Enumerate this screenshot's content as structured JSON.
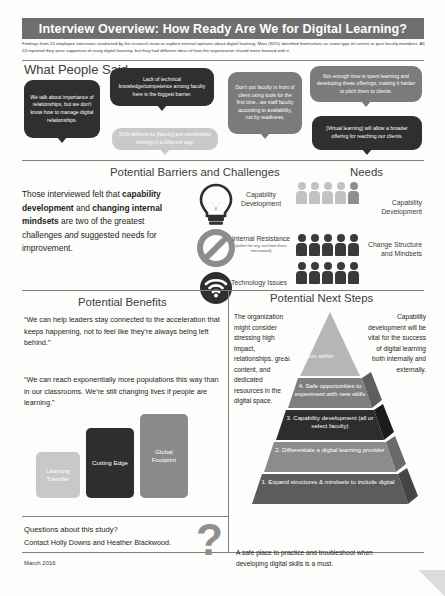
{
  "header": {
    "title": "Interview Overview: How Ready Are We for Digital Learning?",
    "subtitle": "Findings from 24 employee interviews conducted by the research team to explore internal opinions about digital learning. Most (90%) identified themselves as some type of current or past faculty members. All 24 reported they were supportive of using digital learning, but they had different ideas of how the organization should move forward with it."
  },
  "quotes_section": {
    "title": "What People Said...",
    "bubbles": [
      {
        "id": "q1",
        "text": "We talk about importance of relationships, but we don't know how to manage digital relationships.",
        "tone": "dark"
      },
      {
        "id": "q2",
        "text": "Lack of technical knowledge/competence among faculty here is the biggest barrier.",
        "tone": "dark"
      },
      {
        "id": "q3",
        "text": "Shift skillsets so [faculty] are comfortable training in a different way.",
        "tone": "light"
      },
      {
        "id": "q4",
        "text": "Don't put faculty in front of client using tools for the first time...we staff faculty according to availability, not by readiness.",
        "tone": "mid"
      },
      {
        "id": "q5",
        "text": "Not enough time is spent learning and developing these offerings, making it harder to pitch them to clients.",
        "tone": "mid"
      },
      {
        "id": "q6",
        "text": "[Virtual learning] will allow a broader offering for reaching our clients.",
        "tone": "dark"
      }
    ]
  },
  "barriers_section": {
    "title": "Potential Barriers and Challenges",
    "paragraph_parts": {
      "p1": "Those interviewed felt that ",
      "bold1": "capability development",
      "p2": " and ",
      "bold2": "changing internal mindsets",
      "p3": " are two of the greatest challenges ",
      "italic1": "and",
      "p4": " suggested needs for improvement."
    },
    "items": [
      {
        "icon": "lightbulb-icon",
        "label": "Capability Development",
        "sublabel": ""
      },
      {
        "icon": "prohibited-icon",
        "label": "Internal Resistance",
        "sublabel": "(within the org; not from those interviewed)"
      },
      {
        "icon": "wifi-icon",
        "label": "Technology Issues",
        "sublabel": ""
      }
    ]
  },
  "needs_section": {
    "title": "Needs",
    "items": [
      {
        "label": "Capability Development",
        "people_count": 5,
        "tone": "light"
      },
      {
        "label": "Change Structure and Mindsets",
        "people_count": 5,
        "tone": "dark"
      }
    ]
  },
  "benefits_section": {
    "title": "Potential Benefits",
    "quotes": [
      "“We can help leaders stay connected to the acceleration that keeps happening, not to feel like they’re always being left behind.”",
      "“We can reach exponentially more populations this way than in our classrooms. We’re still changing lives if people are learning.”"
    ],
    "bars": [
      {
        "label": "Learning Transfer",
        "tone": "light"
      },
      {
        "label": "Cutting Edge",
        "tone": "dark"
      },
      {
        "label": "Global Footprint",
        "tone": "mid"
      }
    ]
  },
  "next_steps_section": {
    "title": "Potential Next Steps",
    "left_note": "The organization might consider stressing high impact, relationships, great content, and dedicated resources in the digital space.",
    "right_note": "Capability development will be vital for the success of digital learning both internally and externally.",
    "pyramid": [
      {
        "number": "5.",
        "text": "5. Learn from within",
        "tone": "light"
      },
      {
        "number": "4.",
        "text": "4. Safe opportunities to experiment with new skills",
        "tone": "mid"
      },
      {
        "number": "3.",
        "text": "3. Capability development (all or select faculty)",
        "tone": "dark"
      },
      {
        "number": "2.",
        "text": "2. Differentiate a digital learning provider",
        "tone": "mid"
      },
      {
        "number": "1.",
        "text": "1.    Expand structures & mindsets to include digital",
        "tone": "dark-mid"
      }
    ],
    "footer_note": "A safe place to practice and troubleshoot when developing digital skills is a must."
  },
  "footer": {
    "question_line": "Questions about this study?",
    "contact_line": "Contact Holly Downs and Heather Blackwood.",
    "date": "March 2016",
    "question_mark": "?"
  }
}
